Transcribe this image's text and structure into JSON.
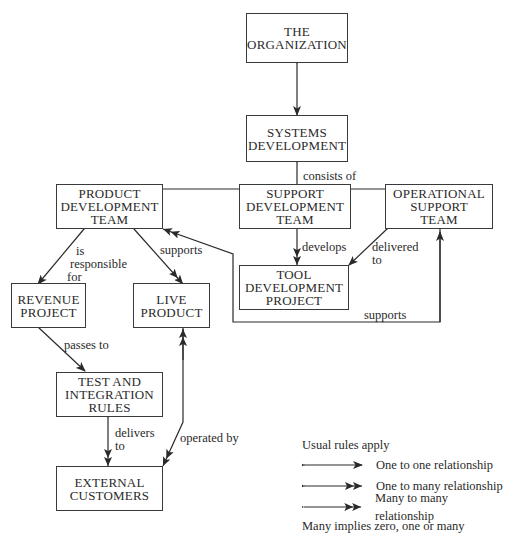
{
  "nodes": {
    "organization": [
      "THE",
      "ORGANIZATION"
    ],
    "systems_development": [
      "SYSTEMS",
      "DEVELOPMENT"
    ],
    "product_development_team": [
      "PRODUCT",
      "DEVELOPMENT",
      "TEAM"
    ],
    "support_development_team": [
      "SUPPORT",
      "DEVELOPMENT",
      "TEAM"
    ],
    "operational_support_team": [
      "OPERATIONAL",
      "SUPPORT",
      "TEAM"
    ],
    "tool_development_project": [
      "TOOL",
      "DEVELOPMENT",
      "PROJECT"
    ],
    "revenue_project": [
      "REVENUE",
      "PROJECT"
    ],
    "live_product": [
      "LIVE",
      "PRODUCT"
    ],
    "test_and_integration_rules": [
      "TEST AND",
      "INTEGRATION",
      "RULES"
    ],
    "external_customers": [
      "EXTERNAL",
      "CUSTOMERS"
    ]
  },
  "edges": {
    "consists_of": "consists of",
    "is_responsible_for": [
      "is",
      "responsible",
      "for"
    ],
    "supports_live": "supports",
    "develops": "develops",
    "delivered_to": [
      "delivered",
      "to"
    ],
    "supports_ops": "supports",
    "passes_to": "passes to",
    "delivers_to": [
      "delivers",
      "to"
    ],
    "operated_by": "operated by"
  },
  "legend": {
    "title": "Usual rules apply",
    "items": [
      {
        "label": "One to one relationship"
      },
      {
        "label": "One to many relationship"
      },
      {
        "label": "Many to many relationship"
      }
    ],
    "footnote": "Many implies zero, one or many"
  }
}
